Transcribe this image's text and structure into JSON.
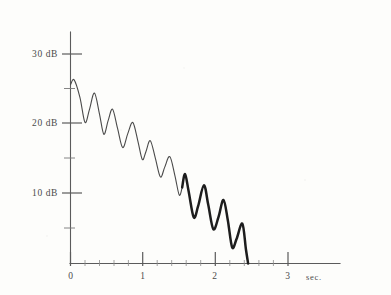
{
  "chart_data": {
    "type": "line",
    "title": "",
    "subtitle": "",
    "xlabel": "sec.",
    "ylabel": "dB",
    "xlim": [
      0,
      3
    ],
    "ylim": [
      0,
      32
    ],
    "grid": false,
    "legend": null,
    "x_ticks_major": [
      0,
      1,
      2,
      3
    ],
    "x_tick_labels": [
      "0",
      "1",
      "2",
      "3"
    ],
    "x_ticks_minor": [
      0.2,
      0.4,
      0.6,
      0.8,
      1.2,
      1.4,
      1.6,
      1.8,
      2.2,
      2.4,
      2.6,
      2.8
    ],
    "y_ticks_major": [
      10,
      20,
      30
    ],
    "y_tick_labels": [
      "10 dB",
      "20 dB",
      "30 dB"
    ],
    "y_ticks_minor": [
      5,
      15,
      25
    ],
    "series": [
      {
        "name": "decay",
        "x": [
          0.0,
          0.05,
          0.13,
          0.2,
          0.26,
          0.33,
          0.4,
          0.46,
          0.52,
          0.58,
          0.65,
          0.72,
          0.79,
          0.86,
          0.93,
          0.99,
          1.04,
          1.1,
          1.17,
          1.24,
          1.3,
          1.37,
          1.44,
          1.5,
          1.54,
          1.58,
          1.63,
          1.7,
          1.76,
          1.84,
          1.9,
          1.97,
          2.04,
          2.11,
          2.17,
          2.23,
          2.29,
          2.37,
          2.42,
          2.45
        ],
        "y": [
          25.6,
          26.3,
          23.8,
          20.2,
          22.0,
          24.4,
          21.4,
          18.5,
          20.5,
          22.1,
          19.3,
          16.6,
          18.6,
          20.2,
          17.5,
          14.9,
          16.0,
          17.6,
          15.1,
          12.4,
          13.8,
          15.3,
          12.6,
          9.8,
          10.9,
          12.8,
          10.3,
          6.6,
          8.2,
          11.2,
          8.4,
          4.9,
          6.6,
          9.1,
          6.2,
          2.3,
          3.5,
          5.7,
          2.0,
          0.0
        ]
      }
    ],
    "emphasis": {
      "note": "curve drawn with a heavier/darker stroke after about 1.55 sec",
      "dark_start_sec": 1.54
    }
  },
  "labels": {
    "y30": "30 dB",
    "y20": "20 dB",
    "y10": "10 dB",
    "x0": "0",
    "x1": "1",
    "x2": "2",
    "x3": "3",
    "xunit": "sec."
  },
  "colors": {
    "background": "#fdfdfb",
    "axis": "#5b5b5b",
    "curve_light": "#4a4a4a",
    "curve_dark": "#1d1d1d",
    "text": "#4b4b4b"
  }
}
